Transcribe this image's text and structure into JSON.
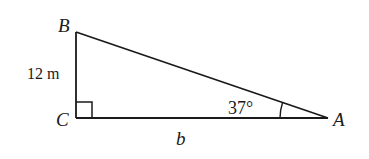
{
  "diagram": {
    "type": "right-triangle",
    "vertices": {
      "A": {
        "label": "A",
        "x": 328,
        "y": 118
      },
      "B": {
        "label": "B",
        "x": 76,
        "y": 32
      },
      "C": {
        "label": "C",
        "x": 76,
        "y": 118
      }
    },
    "right_angle_at": "C",
    "sides": {
      "BC": {
        "label": "12 m"
      },
      "CA": {
        "label": "b"
      }
    },
    "angles": {
      "A": {
        "label": "37°"
      }
    },
    "colors": {
      "stroke": "#1a1a1a",
      "background": "#ffffff"
    }
  }
}
